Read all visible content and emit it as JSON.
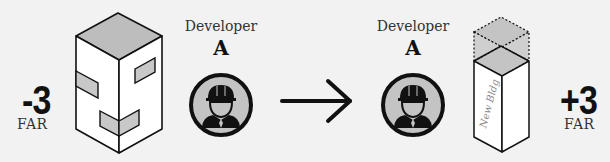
{
  "left": {
    "far_change": "-3",
    "far_label": "FAR"
  },
  "developer_before": {
    "label": "Developer",
    "letter": "A",
    "icon": "construction-worker-icon"
  },
  "transition": {
    "icon": "arrow-right-icon"
  },
  "developer_after": {
    "label": "Developer",
    "letter": "A",
    "icon": "construction-worker-icon"
  },
  "new_building": {
    "label": "New Bldg"
  },
  "right": {
    "far_change": "+3",
    "far_label": "FAR"
  },
  "colors": {
    "background": "#f2f2f2",
    "roof_gray": "#bdbdbd",
    "window_gray": "#c8c8c8",
    "badge_fill": "#c4c4c4",
    "stroke": "#111111"
  }
}
